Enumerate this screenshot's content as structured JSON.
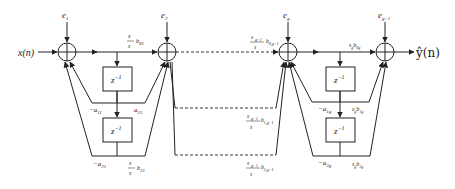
{
  "diagram": {
    "type": "signal-flow block diagram (cascaded second-order sections)",
    "input_label": "x(n)",
    "output_label": "ŷ(n)",
    "error_inputs": [
      "e_1",
      "e_2",
      "e_g",
      "e_{g+1}"
    ],
    "delay_label": "z^{-1}",
    "colors": {
      "stroke": "#222222",
      "background": "#ffffff"
    },
    "stage1": {
      "feedforward_top": "s_1/s_1 · b_{01}",
      "coef_a1": "-a_{11}",
      "coef_b1": "a_{21}",
      "coef_a2": "-a_{21}",
      "coef_b2": "s_1/s_1 · b_{21}"
    },
    "stageg": {
      "feedforward_top": "s_{g-1}/s_g · b_{0,g-1}",
      "coef_b1": "s_{g-1}/s_g · b_{1,g-1}",
      "coef_b2": "s_{g-1}/s_g · b_{2,g-1}",
      "coef_a1": "-a_{1g}",
      "coef_a2": "-a_{2g}",
      "out_b0": "s_g b_{0g}",
      "out_b1": "s_g b_{1g}",
      "out_b2": "s_g b_{2g}"
    }
  },
  "labels": {
    "xn": "x(n)",
    "yn": "ŷ(n)",
    "e1": "e",
    "e1_sub": "1",
    "e2": "e",
    "e2_sub": "2",
    "eg": "e",
    "eg_sub": "g",
    "eg1": "e",
    "eg1_sub": "g+1",
    "z": "z",
    "zexp": "−1",
    "s1": "s",
    "s1_sub": "1",
    "b01": "b",
    "b01_sub": "01",
    "b21": "b",
    "b21_sub": "21",
    "a11": "−a",
    "a11_sub": "11",
    "a21n": "−a",
    "a21n_sub": "21",
    "a21": "a",
    "a21_sub": "21",
    "sg1": "s",
    "sg1_sub": "g−1",
    "sg": "s",
    "sg_sub": "g",
    "b0g1": "b",
    "b0g1_sub": "0,g−1",
    "b1g1": "b",
    "b1g1_sub": "1,g−1",
    "b2g1": "b",
    "b2g1_sub": "2,g−1",
    "a1g": "−a",
    "a1g_sub": "1g",
    "a2g": "−a",
    "a2g_sub": "2g",
    "b0g": "b",
    "b0g_sub": "0g",
    "b1g": "b",
    "b1g_sub": "1g",
    "b2g": "b",
    "b2g_sub": "2g"
  }
}
